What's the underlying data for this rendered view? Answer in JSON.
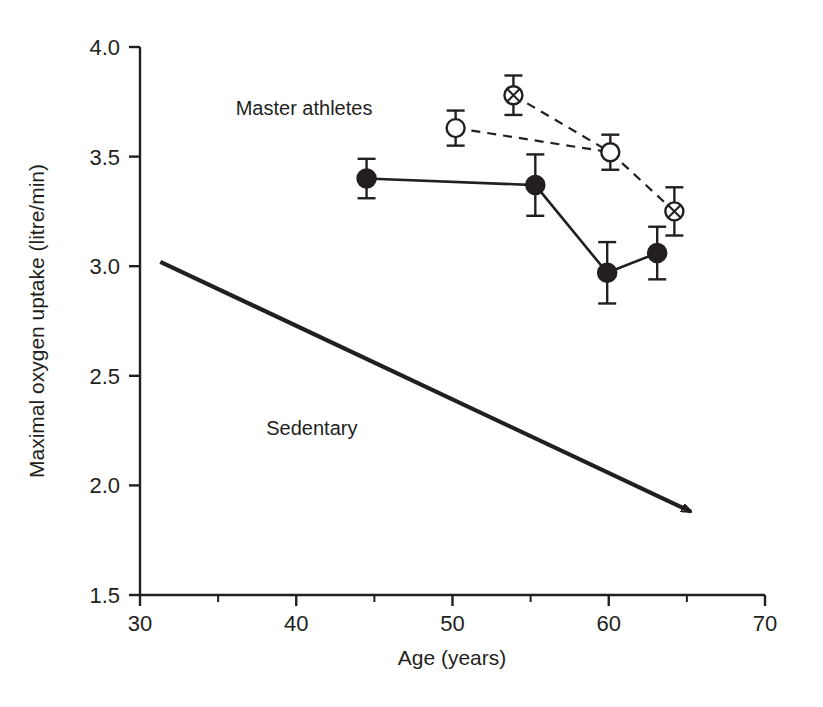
{
  "chart_data": {
    "type": "line",
    "title": "",
    "xlabel": "Age (years)",
    "ylabel": "Maximal oxygen uptake (litre/min)",
    "xlim": [
      30,
      70
    ],
    "ylim": [
      1.5,
      4.0
    ],
    "xticks": [
      30,
      40,
      50,
      60,
      70
    ],
    "xticklabels": [
      "30",
      "40",
      "50",
      "60",
      "70"
    ],
    "xminorticks": [
      35,
      45,
      55,
      65
    ],
    "yticks": [
      1.5,
      2.0,
      2.5,
      3.0,
      3.5,
      4.0
    ],
    "yticklabels": [
      "1.5",
      "2.0",
      "2.5",
      "3.0",
      "3.5",
      "4.0"
    ],
    "grid": false,
    "legend_position": "inline-annotations",
    "annotations": [
      {
        "text": "Master athletes",
        "x": 40.5,
        "y": 3.69
      },
      {
        "text": "Sedentary",
        "x": 41.0,
        "y": 2.23
      }
    ],
    "series": [
      {
        "name": "Master athletes - filled circles (solid line)",
        "marker": "filled-circle",
        "linestyle": "solid",
        "x": [
          44.5,
          55.3,
          59.9,
          63.1
        ],
        "y": [
          3.4,
          3.37,
          2.97,
          3.06
        ],
        "yerr": [
          0.09,
          0.14,
          0.14,
          0.12
        ]
      },
      {
        "name": "Master athletes - open circles (dashed line)",
        "marker": "open-circle",
        "linestyle": "dashed",
        "x": [
          50.2,
          60.1
        ],
        "y": [
          3.63,
          3.52
        ],
        "yerr": [
          0.08,
          0.08
        ]
      },
      {
        "name": "Master athletes - crossed circles (dashed line)",
        "marker": "crossed-circle",
        "linestyle": "dashed",
        "x": [
          53.9,
          64.2
        ],
        "y": [
          3.78,
          3.25
        ],
        "yerr": [
          0.09,
          0.11
        ]
      },
      {
        "name": "Sedentary - trend arrow",
        "marker": "arrow",
        "linestyle": "solid-thick-arrow",
        "x": [
          31.3,
          65.7
        ],
        "y": [
          3.02,
          1.87
        ],
        "yerr": []
      }
    ],
    "dashed_link_series": [
      {
        "name": "dashed link open-to-crossed",
        "from": {
          "x": 53.9,
          "y": 3.78
        },
        "to": {
          "x": 60.1,
          "y": 3.52
        }
      },
      {
        "name": "dashed link open50-to-open60",
        "from": {
          "x": 50.2,
          "y": 3.63
        },
        "to": {
          "x": 60.1,
          "y": 3.52
        }
      },
      {
        "name": "dashed link open60-to-crossed64",
        "from": {
          "x": 60.1,
          "y": 3.52
        },
        "to": {
          "x": 64.2,
          "y": 3.25
        }
      }
    ],
    "colors": {
      "axis": "#231f20",
      "marker_fill": "#231f20",
      "marker_open_fill": "#ffffff",
      "line": "#231f20",
      "background": "#ffffff"
    }
  }
}
